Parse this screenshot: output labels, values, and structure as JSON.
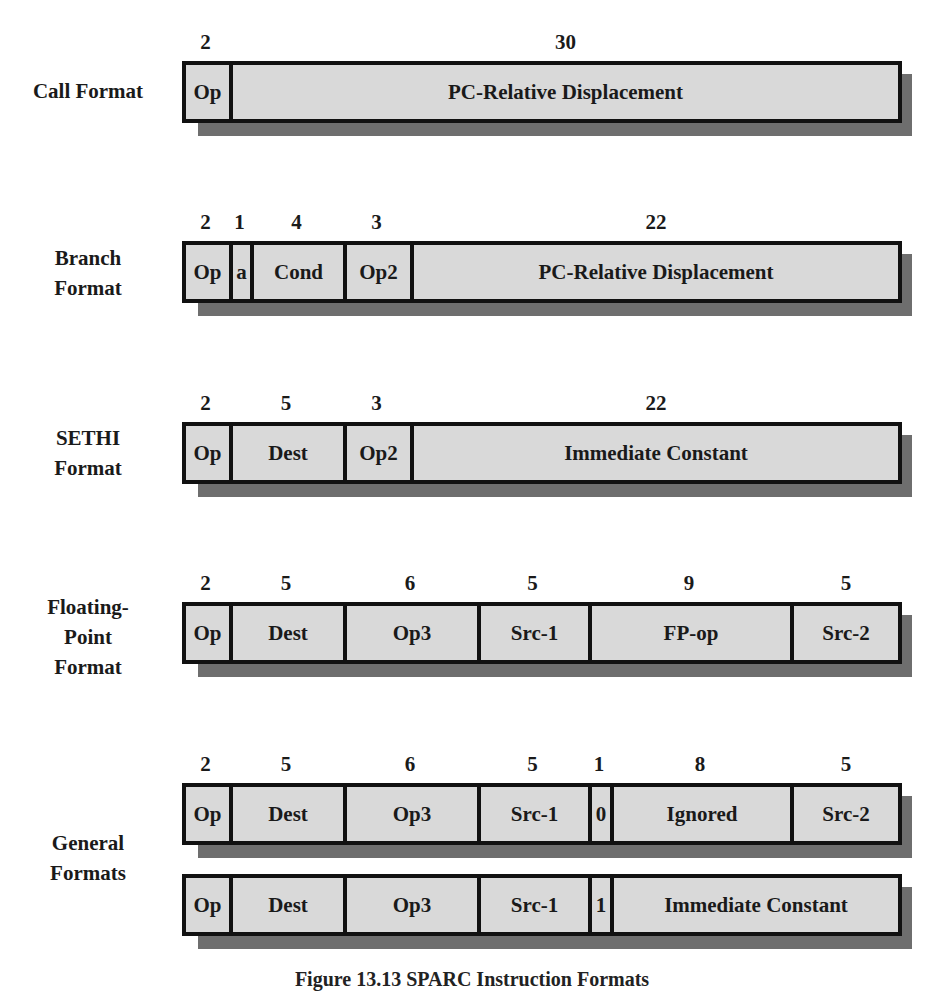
{
  "title": "SPARC Instruction Formats",
  "caption": "Figure 13.13  SPARC Instruction Formats",
  "colors": {
    "field_fill": "#d9d9d9",
    "border": "#111111",
    "shadow": "#6e6e6e"
  },
  "formats": [
    {
      "label": [
        "Call Format"
      ],
      "rows": [
        {
          "fields": [
            {
              "name": "Op",
              "bits": "2",
              "width": 47
            },
            {
              "name": "PC-Relative Displacement",
              "bits": "30",
              "width": 673
            }
          ]
        }
      ]
    },
    {
      "label": [
        "Branch",
        "Format"
      ],
      "rows": [
        {
          "fields": [
            {
              "name": "Op",
              "bits": "2",
              "width": 47
            },
            {
              "name": "a",
              "bits": "1",
              "width": 21
            },
            {
              "name": "Cond",
              "bits": "4",
              "width": 93
            },
            {
              "name": "Op2",
              "bits": "3",
              "width": 67
            },
            {
              "name": "PC-Relative Displacement",
              "bits": "22",
              "width": 492
            }
          ]
        }
      ]
    },
    {
      "label": [
        "SETHI",
        "Format"
      ],
      "rows": [
        {
          "fields": [
            {
              "name": "Op",
              "bits": "2",
              "width": 47
            },
            {
              "name": "Dest",
              "bits": "5",
              "width": 114
            },
            {
              "name": "Op2",
              "bits": "3",
              "width": 67
            },
            {
              "name": "Immediate Constant",
              "bits": "22",
              "width": 492
            }
          ]
        }
      ]
    },
    {
      "label": [
        "Floating-",
        "Point",
        "Format"
      ],
      "rows": [
        {
          "fields": [
            {
              "name": "Op",
              "bits": "2",
              "width": 47
            },
            {
              "name": "Dest",
              "bits": "5",
              "width": 114
            },
            {
              "name": "Op3",
              "bits": "6",
              "width": 134
            },
            {
              "name": "Src-1",
              "bits": "5",
              "width": 111
            },
            {
              "name": "FP-op",
              "bits": "9",
              "width": 202
            },
            {
              "name": "Src-2",
              "bits": "5",
              "width": 112
            }
          ]
        }
      ]
    },
    {
      "label": [
        "General",
        "Formats"
      ],
      "rows": [
        {
          "fields": [
            {
              "name": "Op",
              "bits": "2",
              "width": 47
            },
            {
              "name": "Dest",
              "bits": "5",
              "width": 114
            },
            {
              "name": "Op3",
              "bits": "6",
              "width": 134
            },
            {
              "name": "Src-1",
              "bits": "5",
              "width": 111
            },
            {
              "name": "0",
              "bits": "1",
              "width": 22
            },
            {
              "name": "Ignored",
              "bits": "8",
              "width": 180
            },
            {
              "name": "Src-2",
              "bits": "5",
              "width": 112
            }
          ]
        },
        {
          "fields": [
            {
              "name": "Op",
              "bits": "",
              "width": 47
            },
            {
              "name": "Dest",
              "bits": "",
              "width": 114
            },
            {
              "name": "Op3",
              "bits": "",
              "width": 134
            },
            {
              "name": "Src-1",
              "bits": "",
              "width": 111
            },
            {
              "name": "1",
              "bits": "",
              "width": 22
            },
            {
              "name": "Immediate Constant",
              "bits": "",
              "width": 292
            }
          ]
        }
      ]
    }
  ]
}
